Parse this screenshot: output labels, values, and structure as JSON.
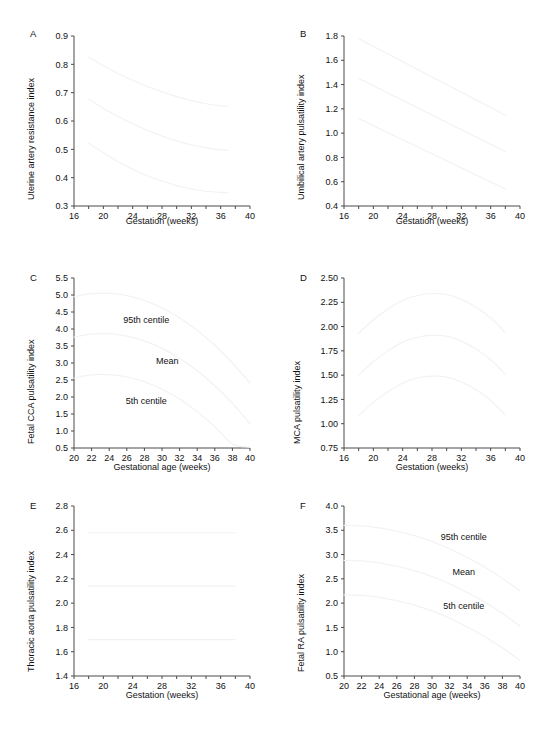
{
  "figure": {
    "panels": [
      "A",
      "B",
      "C",
      "D",
      "E",
      "F"
    ],
    "series_labels": [
      "95th centile",
      "Mean",
      "5th centile"
    ],
    "caption": ""
  },
  "chart_data": [
    {
      "panel": "A",
      "type": "line",
      "title": "",
      "xlabel": "Gestation (weeks)",
      "ylabel": "Uterine artery resistance index",
      "xlim": [
        16,
        40
      ],
      "ylim": [
        0.3,
        0.9
      ],
      "xticks": [
        16,
        18,
        20,
        22,
        24,
        26,
        28,
        30,
        32,
        34,
        36,
        38,
        40
      ],
      "xticklabels": [
        "16",
        "",
        "20",
        "",
        "24",
        "",
        "28",
        "",
        "32",
        "",
        "36",
        "",
        "40"
      ],
      "yticks": [
        0.3,
        0.4,
        0.5,
        0.6,
        0.7,
        0.8,
        0.9
      ],
      "yticklabels": [
        "0.3",
        "0.4",
        "0.5",
        "0.6",
        "0.7",
        "0.8",
        "0.9"
      ],
      "grid": false,
      "legend": "none",
      "x": [
        18,
        20,
        22,
        24,
        26,
        28,
        30,
        32,
        34,
        36,
        37
      ],
      "series": [
        {
          "name": "95th centile",
          "values": [
            0.825,
            0.795,
            0.768,
            0.744,
            0.722,
            0.703,
            0.686,
            0.672,
            0.661,
            0.654,
            0.652
          ]
        },
        {
          "name": "Mean",
          "values": [
            0.678,
            0.645,
            0.616,
            0.59,
            0.567,
            0.547,
            0.53,
            0.516,
            0.505,
            0.498,
            0.496
          ]
        },
        {
          "name": "5th centile",
          "values": [
            0.522,
            0.488,
            0.457,
            0.43,
            0.407,
            0.388,
            0.372,
            0.36,
            0.352,
            0.348,
            0.347
          ]
        }
      ]
    },
    {
      "panel": "B",
      "type": "line",
      "title": "",
      "xlabel": "Gestation (weeks)",
      "ylabel": "Umbilical artery pulsatility index",
      "xlim": [
        16,
        40
      ],
      "ylim": [
        0.4,
        1.8
      ],
      "xticks": [
        16,
        18,
        20,
        22,
        24,
        26,
        28,
        30,
        32,
        34,
        36,
        38,
        40
      ],
      "xticklabels": [
        "16",
        "",
        "20",
        "",
        "24",
        "",
        "28",
        "",
        "32",
        "",
        "36",
        "",
        "40"
      ],
      "yticks": [
        0.4,
        0.6,
        0.8,
        1.0,
        1.2,
        1.4,
        1.6,
        1.8
      ],
      "yticklabels": [
        "0.4",
        "0.6",
        "0.8",
        "1.0",
        "1.2",
        "1.4",
        "1.6",
        "1.8"
      ],
      "grid": false,
      "legend": "none",
      "x": [
        18,
        20,
        22,
        24,
        26,
        28,
        30,
        32,
        34,
        36,
        38
      ],
      "series": [
        {
          "name": "95th centile",
          "values": [
            1.78,
            1.715,
            1.652,
            1.589,
            1.526,
            1.463,
            1.4,
            1.337,
            1.274,
            1.211,
            1.148
          ]
        },
        {
          "name": "Mean",
          "values": [
            1.45,
            1.39,
            1.329,
            1.269,
            1.209,
            1.149,
            1.088,
            1.028,
            0.968,
            0.908,
            0.848
          ]
        },
        {
          "name": "5th centile",
          "values": [
            1.12,
            1.062,
            1.004,
            0.946,
            0.888,
            0.83,
            0.772,
            0.714,
            0.656,
            0.598,
            0.54
          ]
        }
      ]
    },
    {
      "panel": "C",
      "type": "line",
      "title": "",
      "xlabel": "Gestational age (weeks)",
      "ylabel": "Fetal CCA pulsatility index",
      "xlim": [
        20,
        40
      ],
      "ylim": [
        0.5,
        5.5
      ],
      "xticks": [
        20,
        22,
        24,
        26,
        28,
        30,
        32,
        34,
        36,
        38,
        40
      ],
      "xticklabels": [
        "20",
        "22",
        "24",
        "26",
        "28",
        "30",
        "32",
        "34",
        "36",
        "38",
        "40"
      ],
      "yticks": [
        0.5,
        1.0,
        1.5,
        2.0,
        2.5,
        3.0,
        3.5,
        4.0,
        4.5,
        5.0,
        5.5
      ],
      "yticklabels": [
        "0.5",
        "1.0",
        "1.5",
        "2.0",
        "2.5",
        "3.0",
        "3.5",
        "4.0",
        "4.5",
        "5.0",
        "5.5"
      ],
      "grid": false,
      "legend": "inline",
      "annotations": [
        {
          "text": "95th centile",
          "x": 28.2,
          "y": 4.18
        },
        {
          "text": "Mean",
          "x": 30.6,
          "y": 2.97
        },
        {
          "text": "5th centile",
          "x": 28.2,
          "y": 1.78
        }
      ],
      "x": [
        20,
        22,
        24,
        26,
        28,
        30,
        32,
        34,
        36,
        38,
        40
      ],
      "series": [
        {
          "name": "95th centile",
          "values": [
            4.95,
            5.04,
            5.05,
            4.98,
            4.84,
            4.62,
            4.33,
            3.96,
            3.52,
            3.0,
            2.41
          ]
        },
        {
          "name": "Mean",
          "values": [
            3.76,
            3.85,
            3.86,
            3.79,
            3.65,
            3.43,
            3.14,
            2.77,
            2.33,
            1.81,
            1.22
          ]
        },
        {
          "name": "5th centile",
          "values": [
            2.56,
            2.65,
            2.66,
            2.59,
            2.45,
            2.23,
            1.94,
            1.57,
            1.13,
            0.62,
            0.52
          ]
        }
      ]
    },
    {
      "panel": "D",
      "type": "line",
      "title": "",
      "xlabel": "Gestation (weeks)",
      "ylabel": "MCA pulsatility index",
      "xlim": [
        16,
        40
      ],
      "ylim": [
        0.75,
        2.5
      ],
      "xticks": [
        16,
        18,
        20,
        22,
        24,
        26,
        28,
        30,
        32,
        34,
        36,
        38,
        40
      ],
      "xticklabels": [
        "16",
        "",
        "20",
        "",
        "24",
        "",
        "28",
        "",
        "32",
        "",
        "36",
        "",
        "40"
      ],
      "yticks": [
        0.75,
        1.0,
        1.25,
        1.5,
        1.75,
        2.0,
        2.25,
        2.5
      ],
      "yticklabels": [
        "0.75",
        "1.00",
        "1.25",
        "1.50",
        "1.75",
        "2.00",
        "2.25",
        "2.50"
      ],
      "grid": false,
      "legend": "none",
      "x": [
        18,
        20,
        22,
        24,
        26,
        28,
        30,
        32,
        34,
        36,
        38
      ],
      "series": [
        {
          "name": "95th centile",
          "values": [
            1.93,
            2.07,
            2.18,
            2.27,
            2.32,
            2.34,
            2.33,
            2.28,
            2.2,
            2.09,
            1.94
          ]
        },
        {
          "name": "Mean",
          "values": [
            1.5,
            1.64,
            1.75,
            1.84,
            1.89,
            1.91,
            1.9,
            1.85,
            1.77,
            1.66,
            1.51
          ]
        },
        {
          "name": "5th centile",
          "values": [
            1.08,
            1.22,
            1.33,
            1.42,
            1.47,
            1.49,
            1.48,
            1.43,
            1.35,
            1.24,
            1.09
          ]
        }
      ]
    },
    {
      "panel": "E",
      "type": "line",
      "title": "",
      "xlabel": "Gestation (weeks)",
      "ylabel": "Thoracic aorta pulsatility index",
      "xlim": [
        16,
        40
      ],
      "ylim": [
        1.4,
        2.8
      ],
      "xticks": [
        16,
        18,
        20,
        22,
        24,
        26,
        28,
        30,
        32,
        34,
        36,
        38,
        40
      ],
      "xticklabels": [
        "16",
        "",
        "20",
        "",
        "24",
        "",
        "28",
        "",
        "32",
        "",
        "36",
        "",
        "40"
      ],
      "yticks": [
        1.4,
        1.6,
        1.8,
        2.0,
        2.2,
        2.4,
        2.6,
        2.8
      ],
      "yticklabels": [
        "1.4",
        "1.6",
        "1.8",
        "2.0",
        "2.2",
        "2.4",
        "2.6",
        "2.8"
      ],
      "grid": false,
      "legend": "none",
      "x": [
        18,
        38
      ],
      "series": [
        {
          "name": "95th centile",
          "values": [
            2.58,
            2.58
          ]
        },
        {
          "name": "Mean",
          "values": [
            2.14,
            2.14
          ]
        },
        {
          "name": "5th centile",
          "values": [
            1.7,
            1.7
          ]
        }
      ]
    },
    {
      "panel": "F",
      "type": "line",
      "title": "",
      "xlabel": "Gestational age (weeks)",
      "ylabel": "Fetal RA pulsatility index",
      "xlim": [
        20,
        40
      ],
      "ylim": [
        0.5,
        4.0
      ],
      "xticks": [
        20,
        22,
        24,
        26,
        28,
        30,
        32,
        34,
        36,
        38,
        40
      ],
      "xticklabels": [
        "20",
        "22",
        "24",
        "26",
        "28",
        "30",
        "32",
        "34",
        "36",
        "38",
        "40"
      ],
      "yticks": [
        0.5,
        1.0,
        1.5,
        2.0,
        2.5,
        3.0,
        3.5,
        4.0
      ],
      "yticklabels": [
        "0.5",
        "1.0",
        "1.5",
        "2.0",
        "2.5",
        "3.0",
        "3.5",
        "4.0"
      ],
      "grid": false,
      "legend": "inline",
      "annotations": [
        {
          "text": "95th centile",
          "x": 33.6,
          "y": 3.3
        },
        {
          "text": "Mean",
          "x": 33.6,
          "y": 2.57
        },
        {
          "text": "5th centile",
          "x": 33.6,
          "y": 1.88
        }
      ],
      "x": [
        20,
        22,
        24,
        26,
        28,
        30,
        32,
        34,
        36,
        38,
        40
      ],
      "series": [
        {
          "name": "95th centile",
          "values": [
            3.6,
            3.59,
            3.55,
            3.48,
            3.39,
            3.27,
            3.12,
            2.94,
            2.74,
            2.51,
            2.25
          ]
        },
        {
          "name": "Mean",
          "values": [
            2.88,
            2.87,
            2.83,
            2.76,
            2.67,
            2.55,
            2.4,
            2.22,
            2.02,
            1.79,
            1.53
          ]
        },
        {
          "name": "5th centile",
          "values": [
            2.17,
            2.16,
            2.12,
            2.05,
            1.96,
            1.84,
            1.69,
            1.51,
            1.31,
            1.08,
            0.82
          ]
        }
      ]
    }
  ]
}
